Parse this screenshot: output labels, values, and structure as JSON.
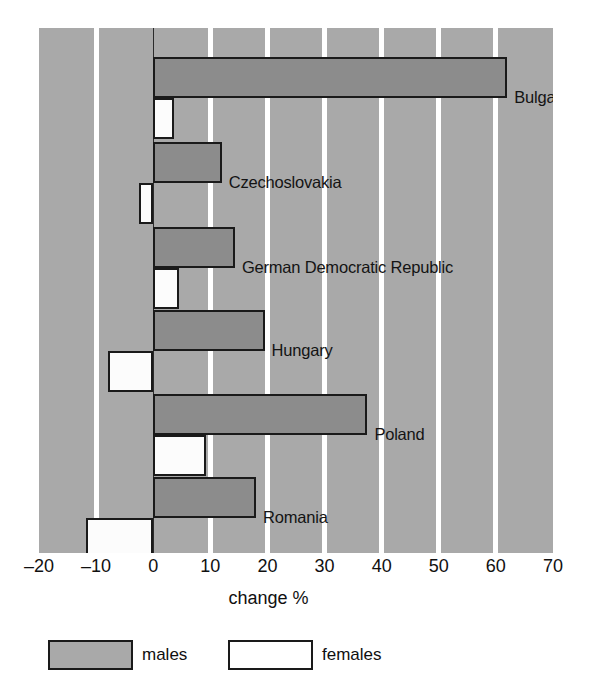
{
  "chart_data": {
    "type": "bar",
    "orientation": "horizontal",
    "title": "",
    "xlabel": "change %",
    "ylabel": "",
    "xlim": [
      -20,
      70
    ],
    "xticks": [
      -20,
      -10,
      0,
      10,
      20,
      30,
      40,
      50,
      60,
      70
    ],
    "xtick_labels": [
      "–20",
      "–10",
      "0",
      "10",
      "20",
      "30",
      "40",
      "50",
      "60",
      "70"
    ],
    "grid": true,
    "grid_orientation": "vertical",
    "legend_position": "below-axis",
    "categories": [
      "Bulgaria",
      "Czechoslovakia",
      "German Democratic Republic",
      "Hungary",
      "Poland",
      "Romania"
    ],
    "series": [
      {
        "name": "males",
        "color": "#8c8c8c",
        "values": [
          62.0,
          12.0,
          14.3,
          19.5,
          37.5,
          18.0
        ]
      },
      {
        "name": "females",
        "color": "#fcfcfc",
        "values": [
          3.7,
          -2.5,
          4.6,
          -7.9,
          9.3,
          -11.8
        ]
      }
    ]
  },
  "axis": {
    "title": "change %",
    "ticks": [
      {
        "value": -20,
        "label": "–20"
      },
      {
        "value": -10,
        "label": "–10"
      },
      {
        "value": 0,
        "label": "0"
      },
      {
        "value": 10,
        "label": "10"
      },
      {
        "value": 20,
        "label": "20"
      },
      {
        "value": 30,
        "label": "30"
      },
      {
        "value": 40,
        "label": "40"
      },
      {
        "value": 50,
        "label": "50"
      },
      {
        "value": 60,
        "label": "60"
      },
      {
        "value": 70,
        "label": "70"
      }
    ]
  },
  "groups": [
    {
      "label": "Bulgaria",
      "male": 62.0,
      "female": 3.7
    },
    {
      "label": "Czechoslovakia",
      "male": 12.0,
      "female": -2.5
    },
    {
      "label": "German Democratic Republic",
      "male": 14.3,
      "female": 4.6
    },
    {
      "label": "Hungary",
      "male": 19.5,
      "female": -7.9
    },
    {
      "label": "Poland",
      "male": 37.5,
      "female": 9.3
    },
    {
      "label": "Romania",
      "male": 18.0,
      "female": -11.8
    }
  ],
  "legend": [
    {
      "key": "males",
      "label": "males",
      "color": "#a9a9a9"
    },
    {
      "key": "females",
      "label": "females",
      "color": "#ffffff"
    }
  ],
  "colors": {
    "plot_background": "#a9a9a9",
    "gridline": "#ffffff",
    "male_bar": "#8c8c8c",
    "female_bar": "#fcfcfc",
    "bar_outline": "#1a1a1a",
    "text": "#101010"
  }
}
